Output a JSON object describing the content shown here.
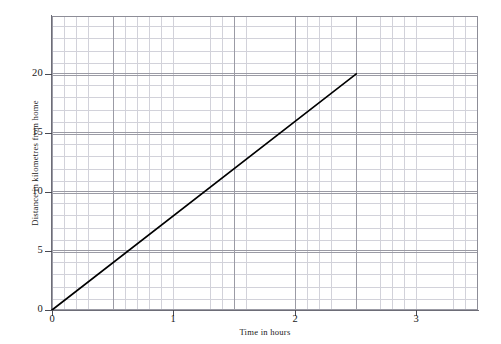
{
  "chart_data": {
    "type": "line",
    "title": "",
    "subtitle": "",
    "xlabel": "Time in hours",
    "ylabel": "Distance in kilometres from home",
    "xlim": [
      0,
      3.5
    ],
    "ylim": [
      0,
      24.9
    ],
    "x_major_step": 1,
    "x_minor_step": 0.1,
    "y_major_step": 5,
    "y_minor_step": 1,
    "grid": true,
    "grid_minor": true,
    "legend": false,
    "legend_position": "none",
    "x_tick_labels": [
      "0",
      "1",
      "2",
      "3"
    ],
    "x_tick_values": [
      0,
      1,
      2,
      3
    ],
    "y_tick_labels": [
      "0",
      "5",
      "10",
      "15",
      "20"
    ],
    "y_tick_values": [
      0,
      5,
      10,
      15,
      20
    ],
    "origin_label": "0",
    "series": [
      {
        "name": "journey",
        "color": "#000000",
        "x": [
          0,
          2.5
        ],
        "y": [
          0,
          20
        ],
        "points": [
          {
            "x": 0,
            "y": 0
          },
          {
            "x": 2.5,
            "y": 20
          }
        ]
      }
    ],
    "annotations": []
  },
  "axes": {
    "x_title": "Time in hours",
    "y_title": "Distance in kilometres from home"
  },
  "colors": {
    "series_line": "#000000",
    "grid_minor": "#d2d2da",
    "grid_major": "#9b9ba5",
    "axis": "#6d6d77",
    "background": "#ffffff",
    "text": "#1a1a1a"
  }
}
